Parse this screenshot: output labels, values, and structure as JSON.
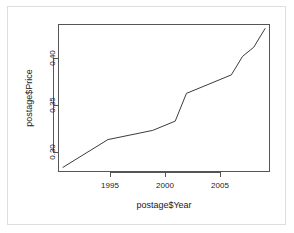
{
  "figure": {
    "background_color": "#ffffff",
    "frame_color": "#dedede",
    "line_color": "#3c3c3c",
    "axis_color": "#555555",
    "text_color": "#1a1a1a"
  },
  "chart_data": {
    "type": "line",
    "title": "",
    "subtitle": "",
    "xlabel": "postage$Year",
    "ylabel": "postage$Price",
    "xlim": [
      1990.6,
      2009.4
    ],
    "ylim": [
      0.2855,
      0.4445
    ],
    "grid": false,
    "legend": null,
    "legend_position": "none",
    "xticks": [
      1995,
      2000,
      2005
    ],
    "xtick_labels": [
      "1995",
      "2000",
      "2005"
    ],
    "yticks": [
      0.3,
      0.35,
      0.4
    ],
    "ytick_labels": [
      "0.30",
      "0.35",
      "0.40"
    ],
    "series": [
      {
        "name": "postage$Price",
        "x": [
          1991,
          1995,
          1999,
          2001,
          2002,
          2006,
          2007,
          2008,
          2009
        ],
        "values": [
          0.29,
          0.32,
          0.33,
          0.34,
          0.37,
          0.39,
          0.41,
          0.42,
          0.44
        ]
      }
    ],
    "annotations": []
  }
}
